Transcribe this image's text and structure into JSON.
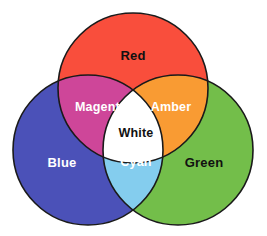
{
  "diagram": {
    "type": "venn-3-circle",
    "background_color": "#ffffff",
    "outline_color": "#1a1a1a",
    "outline_width": 1.6,
    "circles": [
      {
        "name": "red",
        "label": "Red",
        "fill": "#F94E3C",
        "label_color": "#111111",
        "cx": 133,
        "cy": 88,
        "r": 75
      },
      {
        "name": "blue",
        "label": "Blue",
        "fill": "#4B51B8",
        "label_color": "#ffffff",
        "cx": 88,
        "cy": 150,
        "r": 75
      },
      {
        "name": "green",
        "label": "Green",
        "fill": "#73BE4A",
        "label_color": "#111111",
        "cx": 178,
        "cy": 150,
        "r": 75
      }
    ],
    "overlaps": [
      {
        "name": "magenta",
        "label": "Magenta",
        "fill": "#CE4699",
        "label_color": "#ffffff",
        "of": [
          "red",
          "blue"
        ]
      },
      {
        "name": "amber",
        "label": "Amber",
        "fill": "#F99B33",
        "label_color": "#ffffff",
        "of": [
          "red",
          "green"
        ]
      },
      {
        "name": "cyan",
        "label": "Cyan",
        "fill": "#84CDEE",
        "label_color": "#ffffff",
        "of": [
          "blue",
          "green"
        ]
      },
      {
        "name": "white",
        "label": "White",
        "fill": "#FFFFFF",
        "label_color": "#111111",
        "of": [
          "red",
          "blue",
          "green"
        ]
      }
    ],
    "label_positions": {
      "red": {
        "x": 133,
        "y": 57
      },
      "blue": {
        "x": 62,
        "y": 164
      },
      "green": {
        "x": 204,
        "y": 164
      },
      "magenta": {
        "x": 101,
        "y": 108
      },
      "amber": {
        "x": 171,
        "y": 108
      },
      "white": {
        "x": 136,
        "y": 134
      },
      "cyan": {
        "x": 136,
        "y": 163
      }
    }
  }
}
